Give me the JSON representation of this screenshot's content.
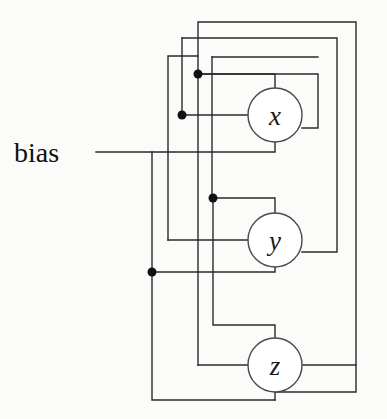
{
  "figure": {
    "background_color": "#fbfbfa",
    "wire_color": "#2b2b2b",
    "node_fill": "#ffffff",
    "node_stroke": "#4a4a4a",
    "dot_color": "#111111"
  },
  "labels": {
    "bias": "bias"
  },
  "nodes": [
    {
      "id": "x",
      "label": "x",
      "cx": 275,
      "cy": 115,
      "r": 27
    },
    {
      "id": "y",
      "label": "y",
      "cx": 275,
      "cy": 240,
      "r": 27
    },
    {
      "id": "z",
      "label": "z",
      "cx": 275,
      "cy": 365,
      "r": 27
    }
  ],
  "junctions": [
    {
      "id": "dot-x-out-upper",
      "cx": 198,
      "cy": 74,
      "r": 4.5
    },
    {
      "id": "dot-x-out-lower",
      "cx": 181,
      "cy": 115,
      "r": 4.5
    },
    {
      "id": "dot-y-out",
      "cx": 213,
      "cy": 198,
      "r": 4.5
    },
    {
      "id": "dot-bias-branch",
      "cx": 152,
      "cy": 272,
      "r": 4.5
    }
  ],
  "wires": [
    {
      "id": "bias-trunk",
      "d": "M 96 152 L 152 152 L 152 400 L 275 400"
    },
    {
      "id": "bias-to-y",
      "d": "M 152 272 L 275 272"
    },
    {
      "id": "x-out-to-right-outer",
      "d": "M 275 88 L 275 74 L 198 74 L 198 22 L 356 22 L 356 392 L 275 392"
    },
    {
      "id": "x-out-to-right-mid",
      "d": "M 198 74 L 198 38 L 337 38 L 337 252 L 275 252"
    },
    {
      "id": "x-out-self-loop",
      "d": "M 198 74 L 318 74 L 318 128 L 275 128"
    },
    {
      "id": "x-in-from-lower",
      "d": "M 181 115 L 248 115"
    },
    {
      "id": "x-out-down-branch",
      "d": "M 181 115 L 181 55 L 307 55 L 307 115"
    },
    {
      "id": "y-out-up-to-x",
      "d": "M 275 213 L 275 198 L 213 198 L 213 62 L 290 62"
    },
    {
      "id": "y-out-to-lower-left",
      "d": "M 213 198 L 213 325 L 275 325"
    },
    {
      "id": "y-in-side",
      "d": "M 168 240 L 248 240"
    },
    {
      "id": "y-left-riser",
      "d": "M 168 240 L 168 55 L 198 55"
    },
    {
      "id": "z-out-left",
      "d": "M 275 338 L 275 325 L 186 325 L 186 70 L 206 70"
    },
    {
      "id": "z-in-left",
      "d": "M 186 365 L 248 365"
    },
    {
      "id": "z-right-tap",
      "d": "M 302 365 L 356 365"
    }
  ]
}
